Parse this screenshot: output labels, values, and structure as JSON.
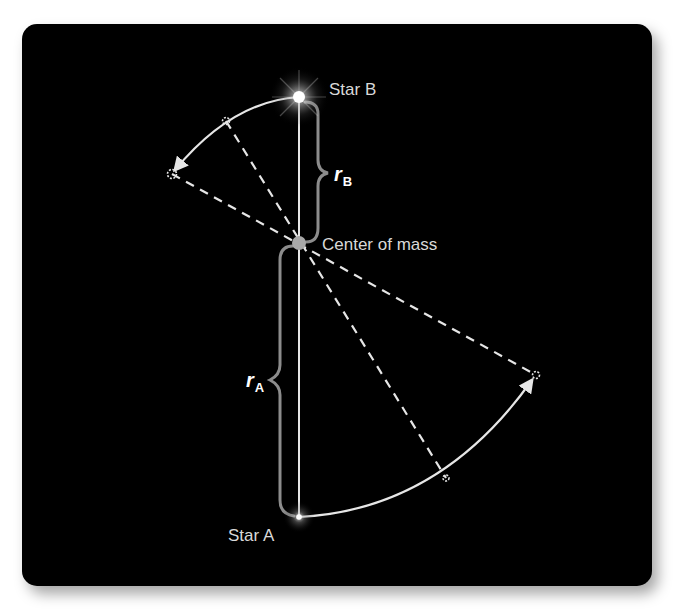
{
  "diagram": {
    "background_color": "#000000",
    "line_color": "#e6e6e6",
    "brace_color": "#8c8c8c",
    "labels": {
      "star_b": "Star B",
      "star_a": "Star A",
      "center_of_mass": "Center of mass",
      "radius_b": "r",
      "radius_b_sub": "B",
      "radius_a": "r",
      "radius_a_sub": "A"
    },
    "points": {
      "star_b": {
        "x": 299,
        "y": 97
      },
      "center_of_mass": {
        "x": 299,
        "y": 243
      },
      "star_a": {
        "x": 299,
        "y": 517
      },
      "star_b_later_1": {
        "x": 226,
        "y": 121
      },
      "star_b_later_2": {
        "x": 172,
        "y": 174
      },
      "star_a_later_1": {
        "x": 446,
        "y": 478
      },
      "star_a_later_2": {
        "x": 536,
        "y": 375
      }
    },
    "relations": [
      "r_A > r_B: Star A is farther from the center of mass than Star B",
      "Dashed lines through center of mass connect simultaneous positions of the two stars",
      "Both stars orbit in the same direction (arrows along arcs)"
    ]
  }
}
